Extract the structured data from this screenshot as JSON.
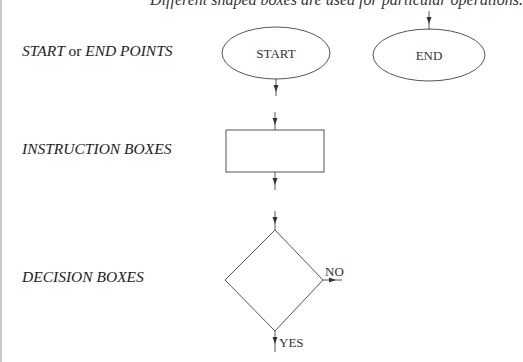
{
  "intro_text": "Different shaped boxes are used for particular operations.",
  "rows": [
    {
      "label_part1": "START",
      "label_connector": "or",
      "label_part2": "END POINTS"
    },
    {
      "label": "INSTRUCTION BOXES"
    },
    {
      "label": "DECISION BOXES"
    }
  ],
  "shapes": {
    "start_text": "START",
    "end_text": "END",
    "decision_no": "NO",
    "decision_yes": "YES"
  },
  "colors": {
    "stroke": "#555555",
    "text": "#333333"
  }
}
